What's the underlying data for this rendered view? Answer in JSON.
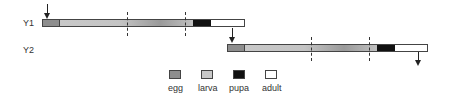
{
  "rows": [
    {
      "label": "Y1"
    },
    {
      "label": "Y2"
    }
  ],
  "legend": [
    {
      "label": "egg",
      "color": "#8e8e8e"
    },
    {
      "label": "larva",
      "color": "#c8c8c8"
    },
    {
      "label": "pupa",
      "color": "#111111"
    },
    {
      "label": "adult",
      "color": "#ffffff"
    }
  ]
}
